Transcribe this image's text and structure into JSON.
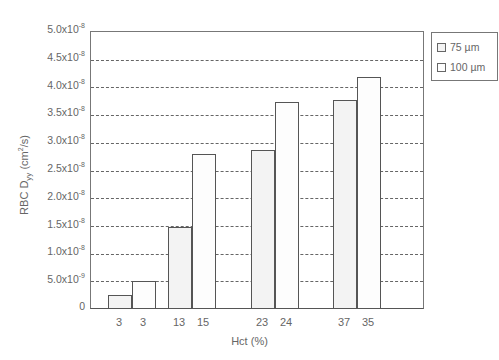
{
  "chart_data": {
    "type": "bar",
    "title": "",
    "xlabel": "Hct (%)",
    "ylabel": "RBC D_yy (cm^2/s)",
    "ylim": [
      0,
      5e-08
    ],
    "grid": true,
    "legend_position": "right-top",
    "groups": [
      "3 / 3",
      "13 / 15",
      "23 / 24",
      "37 / 35"
    ],
    "x_tick_labels": [
      "3",
      "3",
      "13",
      "15",
      "23",
      "24",
      "37",
      "35"
    ],
    "y_tick_labels": [
      "0",
      "5.0x10^-9",
      "1.0x10^-8",
      "1.5x10^-8",
      "2.0x10^-8",
      "2.5x10^-8",
      "3.0x10^-8",
      "3.5x10^-8",
      "4.0x10^-8",
      "4.5x10^-8",
      "5.0x10^-8"
    ],
    "series": [
      {
        "name": "75 µm",
        "hct": [
          3,
          13,
          23,
          37
        ],
        "values": [
          2.3e-09,
          1.47e-08,
          2.85e-08,
          3.75e-08
        ],
        "color": "#f3f3f3"
      },
      {
        "name": "100 µm",
        "hct": [
          3,
          15,
          24,
          35
        ],
        "values": [
          4.9e-09,
          2.78e-08,
          3.72e-08,
          4.17e-08
        ],
        "color": "#fdfdfd"
      }
    ]
  },
  "axis": {
    "ylabel_main": "RBC D",
    "ylabel_sub": "yy",
    "ylabel_unit_pre": " (cm",
    "ylabel_unit_sup": "2",
    "ylabel_unit_post": "/s)",
    "xlabel": "Hct (%)",
    "yticks": [
      {
        "mant": "0",
        "exp": ""
      },
      {
        "mant": "5.0x10",
        "exp": "-9"
      },
      {
        "mant": "1.0x10",
        "exp": "-8"
      },
      {
        "mant": "1.5x10",
        "exp": "-8"
      },
      {
        "mant": "2.0x10",
        "exp": "-8"
      },
      {
        "mant": "2.5x10",
        "exp": "-8"
      },
      {
        "mant": "3.0x10",
        "exp": "-8"
      },
      {
        "mant": "3.5x10",
        "exp": "-8"
      },
      {
        "mant": "4.0x10",
        "exp": "-8"
      },
      {
        "mant": "4.5x10",
        "exp": "-8"
      },
      {
        "mant": "5.0x10",
        "exp": "-8"
      }
    ],
    "xticks": [
      "3",
      "3",
      "13",
      "15",
      "23",
      "24",
      "37",
      "35"
    ]
  },
  "legend": {
    "items": [
      {
        "label": "75 µm"
      },
      {
        "label": "100 µm"
      }
    ]
  }
}
